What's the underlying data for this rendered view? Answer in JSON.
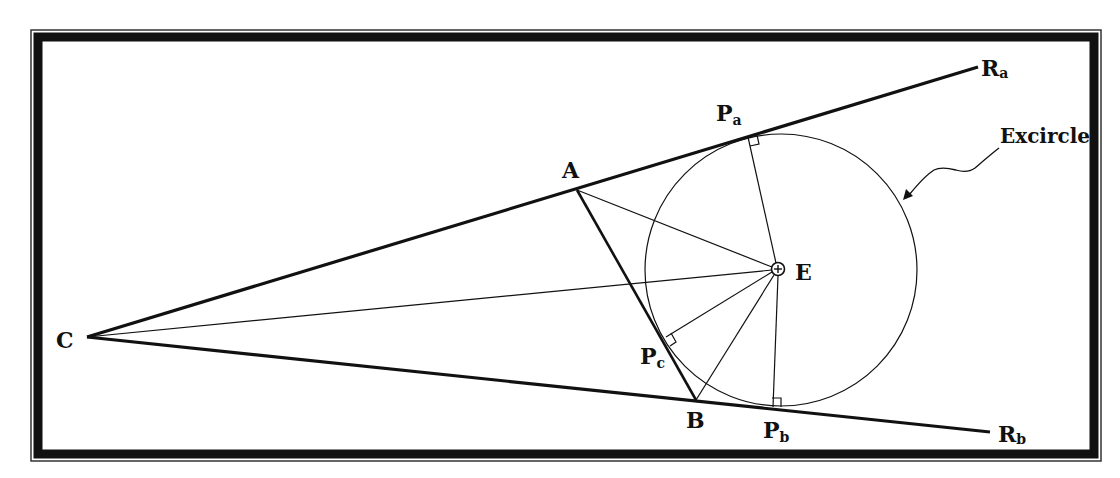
{
  "figure": {
    "colors": {
      "ink": "#111111",
      "background": "#ffffff"
    },
    "points": {
      "C": {
        "label": "C",
        "x": 87,
        "y": 337
      },
      "A": {
        "label": "A",
        "x": 577,
        "y": 190
      },
      "B": {
        "label": "B",
        "x": 696,
        "y": 400
      },
      "E": {
        "label": "E",
        "x": 778,
        "y": 269
      },
      "Pa": {
        "label": "P",
        "sub": "a",
        "x": 748,
        "y": 137
      },
      "Pb": {
        "label": "P",
        "sub": "b",
        "x": 773,
        "y": 407
      },
      "Pc": {
        "label": "P",
        "sub": "c",
        "x": 666,
        "y": 337
      },
      "Ra": {
        "label": "R",
        "sub": "a",
        "x": 978,
        "y": 67
      },
      "Rb": {
        "label": "R",
        "sub": "b",
        "x": 990,
        "y": 432
      }
    },
    "excircle": {
      "label": "Excircle",
      "center_x": 781,
      "center_y": 270,
      "radius": 136
    },
    "rays": [
      {
        "name": "ray-CRa",
        "from": "C",
        "to": "Ra"
      },
      {
        "name": "ray-CRb",
        "from": "C",
        "to": "Rb"
      }
    ],
    "segments": [
      {
        "name": "side-AB",
        "from": "A",
        "to": "B"
      },
      {
        "name": "segment-CE",
        "from": "C",
        "to": "E"
      },
      {
        "name": "segment-AE",
        "from": "A",
        "to": "E"
      },
      {
        "name": "segment-BE",
        "from": "B",
        "to": "E"
      },
      {
        "name": "segment-EPa",
        "from": "E",
        "to": "Pa"
      },
      {
        "name": "segment-EPb",
        "from": "E",
        "to": "Pb"
      },
      {
        "name": "segment-EPc",
        "from": "E",
        "to": "Pc"
      }
    ],
    "right_angle_marks": [
      "Pa",
      "Pb",
      "Pc"
    ]
  }
}
